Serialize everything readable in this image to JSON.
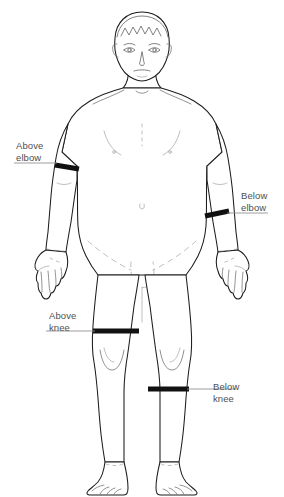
{
  "diagram": {
    "background_color": "#ffffff",
    "outline_color": "#1c1c1c",
    "detail_color": "#6e6e6e",
    "band_color": "#111111",
    "leader_color": "#8d8d8d",
    "label_color": "#4f4f4f"
  },
  "callouts": [
    {
      "id": "above-elbow",
      "label": "Above\nelbow",
      "line1": "Above",
      "line2": "elbow",
      "side": "left",
      "body_part": "upper arm"
    },
    {
      "id": "below-elbow",
      "label": "Below\nelbow",
      "line1": "Below",
      "line2": "elbow",
      "side": "right",
      "body_part": "forearm"
    },
    {
      "id": "above-knee",
      "label": "Above\nknee",
      "line1": "Above",
      "line2": "knee",
      "side": "left",
      "body_part": "thigh"
    },
    {
      "id": "below-knee",
      "label": "Below\nknee",
      "line1": "Below",
      "line2": "knee",
      "side": "right",
      "body_part": "calf"
    }
  ]
}
